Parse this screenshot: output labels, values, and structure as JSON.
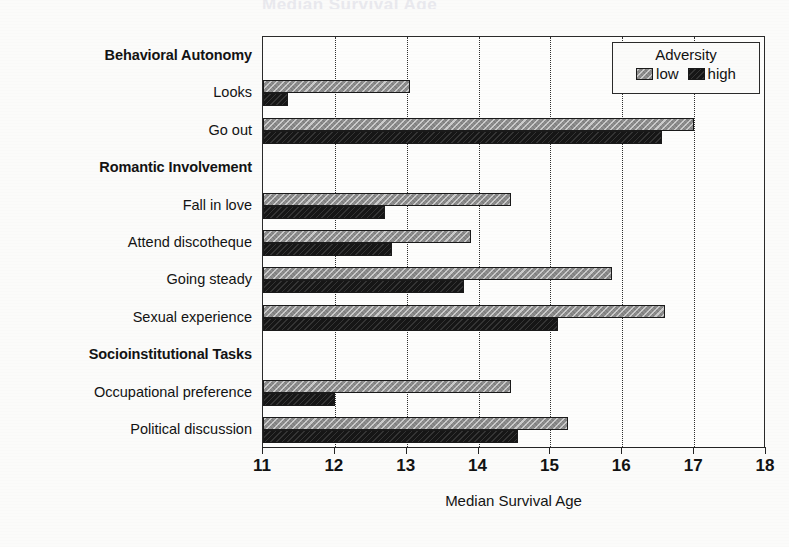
{
  "figure": {
    "title_clipped": "Median Survival Age",
    "background_color": "#fbfbfa"
  },
  "axis": {
    "xlabel": "Median Survival Age",
    "ticks": [
      "11",
      "12",
      "13",
      "14",
      "15",
      "16",
      "17",
      "18"
    ],
    "xmin": 11,
    "xmax": 18
  },
  "legend": {
    "title": "Adversity",
    "items": [
      {
        "label": "low",
        "color": "#8e8e8e"
      },
      {
        "label": "high",
        "color": "#161616"
      }
    ]
  },
  "rows": [
    {
      "label": "Behavioral Autonomy",
      "type": "header"
    },
    {
      "label": "Looks",
      "type": "data"
    },
    {
      "label": "Go out",
      "type": "data"
    },
    {
      "label": "Romantic Involvement",
      "type": "header"
    },
    {
      "label": "Fall in love",
      "type": "data"
    },
    {
      "label": "Attend discotheque",
      "type": "data"
    },
    {
      "label": "Going steady",
      "type": "data"
    },
    {
      "label": "Sexual experience",
      "type": "data"
    },
    {
      "label": "Socioinstitutional Tasks",
      "type": "header"
    },
    {
      "label": "Occupational preference",
      "type": "data"
    },
    {
      "label": "Political discussion",
      "type": "data"
    }
  ],
  "chart_data": {
    "type": "bar",
    "orientation": "horizontal",
    "title": "Median Survival Age",
    "xlabel": "Median Survival Age",
    "ylabel": "",
    "xlim": [
      11,
      18
    ],
    "xticks": [
      11,
      12,
      13,
      14,
      15,
      16,
      17,
      18
    ],
    "grid": "vertical-dotted",
    "legend_title": "Adversity",
    "legend_position": "top-right inside",
    "categories": [
      "Looks",
      "Go out",
      "Fall in love",
      "Attend discotheque",
      "Going steady",
      "Sexual experience",
      "Occupational preference",
      "Political discussion"
    ],
    "category_groups": [
      {
        "group": "Behavioral Autonomy",
        "members": [
          "Looks",
          "Go out"
        ]
      },
      {
        "group": "Romantic Involvement",
        "members": [
          "Fall in love",
          "Attend discotheque",
          "Going steady",
          "Sexual experience"
        ]
      },
      {
        "group": "Socioinstitutional Tasks",
        "members": [
          "Occupational preference",
          "Political discussion"
        ]
      }
    ],
    "series": [
      {
        "name": "low",
        "color": "#8e8e8e",
        "values": [
          13.05,
          17.0,
          14.45,
          13.9,
          15.85,
          16.6,
          14.45,
          15.25
        ]
      },
      {
        "name": "high",
        "color": "#161616",
        "values": [
          11.35,
          16.55,
          12.7,
          12.8,
          13.8,
          15.1,
          12.0,
          14.55
        ]
      }
    ]
  }
}
